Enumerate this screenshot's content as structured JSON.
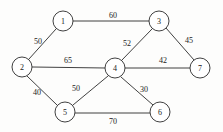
{
  "diagram": {
    "type": "undirected-weighted-graph",
    "background_color": "#fdfdfc",
    "stroke_color": "#2b2b2b",
    "node_fill_color": "#ffffff",
    "node_radius": 10,
    "nodes": [
      {
        "id": "1",
        "label": "1",
        "x": 63,
        "y": 21
      },
      {
        "id": "2",
        "label": "2",
        "x": 22,
        "y": 67
      },
      {
        "id": "3",
        "label": "3",
        "x": 159,
        "y": 21
      },
      {
        "id": "4",
        "label": "4",
        "x": 115,
        "y": 68
      },
      {
        "id": "5",
        "label": "5",
        "x": 65,
        "y": 112
      },
      {
        "id": "6",
        "label": "6",
        "x": 160,
        "y": 112
      },
      {
        "id": "7",
        "label": "7",
        "x": 200,
        "y": 68
      }
    ],
    "edges": [
      {
        "from": "1",
        "to": "3",
        "weight": "60",
        "x1": 73,
        "y1": 21,
        "x2": 149,
        "y2": 21,
        "lx": 113,
        "ly": 15
      },
      {
        "from": "1",
        "to": "2",
        "weight": "50",
        "x1": 56,
        "y1": 29,
        "x2": 29,
        "y2": 59,
        "lx": 38,
        "ly": 41
      },
      {
        "from": "2",
        "to": "4",
        "weight": "65",
        "x1": 32,
        "y1": 67,
        "x2": 105,
        "y2": 68,
        "lx": 68,
        "ly": 60
      },
      {
        "from": "2",
        "to": "5",
        "weight": "40",
        "x1": 27,
        "y1": 76,
        "x2": 57,
        "y2": 105,
        "lx": 37,
        "ly": 92
      },
      {
        "from": "3",
        "to": "4",
        "weight": "52",
        "x1": 152,
        "y1": 29,
        "x2": 122,
        "y2": 60,
        "lx": 127,
        "ly": 43
      },
      {
        "from": "3",
        "to": "7",
        "weight": "45",
        "x1": 166,
        "y1": 28,
        "x2": 194,
        "y2": 60,
        "lx": 189,
        "ly": 40
      },
      {
        "from": "4",
        "to": "7",
        "weight": "42",
        "x1": 125,
        "y1": 68,
        "x2": 190,
        "y2": 68,
        "lx": 163,
        "ly": 60
      },
      {
        "from": "4",
        "to": "5",
        "weight": "50",
        "x1": 108,
        "y1": 76,
        "x2": 73,
        "y2": 105,
        "lx": 76,
        "ly": 88
      },
      {
        "from": "4",
        "to": "6",
        "weight": "30",
        "x1": 121,
        "y1": 77,
        "x2": 153,
        "y2": 105,
        "lx": 144,
        "ly": 89
      },
      {
        "from": "5",
        "to": "6",
        "weight": "70",
        "x1": 75,
        "y1": 113,
        "x2": 150,
        "y2": 113,
        "lx": 113,
        "ly": 121
      }
    ]
  }
}
